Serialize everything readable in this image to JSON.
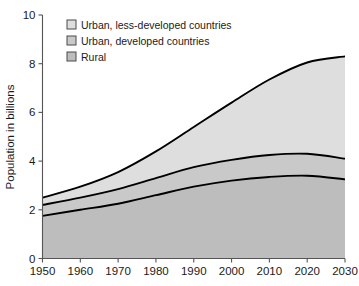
{
  "chart_data": {
    "type": "area",
    "title": "",
    "subtitle": "",
    "xlabel": "",
    "ylabel": "Population in billions",
    "stacked": true,
    "grid": false,
    "legend_position": "top-left-inside",
    "xlim": [
      1950,
      2030
    ],
    "ylim": [
      0,
      10
    ],
    "x": [
      1950,
      1960,
      1970,
      1980,
      1990,
      2000,
      2010,
      2020,
      2030
    ],
    "xtick_labels": [
      "1950",
      "1960",
      "1970",
      "1980",
      "1990",
      "2000",
      "2010",
      "2020",
      "2030"
    ],
    "ytick_labels": [
      "0",
      "2",
      "4",
      "6",
      "8",
      "10"
    ],
    "yticks": [
      0,
      2,
      4,
      6,
      8,
      10
    ],
    "series": [
      {
        "name": "Rural",
        "color": "#bdbdbd",
        "values": [
          1.75,
          2.0,
          2.25,
          2.6,
          2.95,
          3.2,
          3.35,
          3.4,
          3.25
        ]
      },
      {
        "name": "Urban, developed countries",
        "color": "#c9c9c9",
        "values": [
          0.45,
          0.5,
          0.6,
          0.7,
          0.8,
          0.85,
          0.9,
          0.9,
          0.85
        ]
      },
      {
        "name": "Urban, less-developed countries",
        "color": "#dedede",
        "values": [
          0.3,
          0.45,
          0.7,
          1.1,
          1.65,
          2.35,
          3.1,
          3.75,
          4.2
        ]
      }
    ],
    "cumulative_boundaries": {
      "rural_top": [
        1.75,
        2.0,
        2.25,
        2.6,
        2.95,
        3.2,
        3.35,
        3.4,
        3.25
      ],
      "urban_developed_top": [
        2.2,
        2.5,
        2.85,
        3.3,
        3.75,
        4.05,
        4.25,
        4.3,
        4.1
      ],
      "total_top": [
        2.5,
        2.95,
        3.55,
        4.4,
        5.4,
        6.4,
        7.35,
        8.05,
        8.3
      ]
    },
    "legend": [
      {
        "label": "Urban, less-developed countries",
        "color": "#dedede"
      },
      {
        "label": "Urban, developed countries",
        "color": "#c9c9c9"
      },
      {
        "label": "Rural",
        "color": "#bdbdbd"
      }
    ]
  }
}
